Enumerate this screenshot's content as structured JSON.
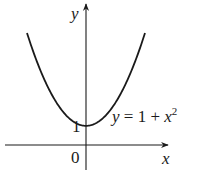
{
  "chart_data": {
    "type": "line",
    "title": "",
    "function": "y = 1 + x^2",
    "annotation": "y = 1 + x²",
    "xlabel": "x",
    "ylabel": "y",
    "tick_labels": {
      "origin": "0",
      "y_tick": "1"
    },
    "series": [
      {
        "name": "y = 1 + x^2",
        "x": [
          -2.2,
          -2,
          -1.5,
          -1,
          -0.5,
          0,
          0.5,
          1,
          1.5,
          2,
          2.2
        ],
        "values": [
          5.84,
          5,
          3.25,
          2,
          1.25,
          1,
          1.25,
          2,
          3.25,
          5,
          5.84
        ]
      }
    ],
    "xlim": [
      -2.2,
      2.2
    ],
    "ylim": [
      -0.8,
      5.8
    ],
    "grid": false,
    "legend": "none",
    "colors": {
      "curve": "#1a1a1a",
      "axes": "#1a1a1a",
      "background": "#ffffff"
    }
  },
  "labels": {
    "y_axis": "y",
    "x_axis": "x",
    "origin": "0",
    "y_intercept": "1",
    "equation_main": "y = 1 + x",
    "equation_exp": "2"
  }
}
